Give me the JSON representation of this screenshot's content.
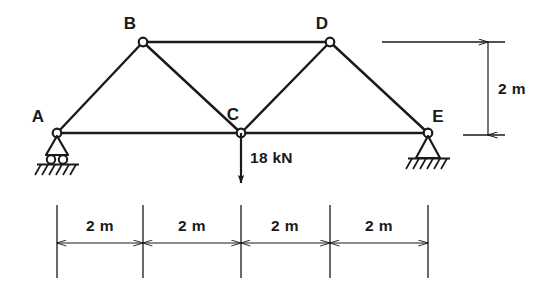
{
  "figure": {
    "type": "structural-truss-diagram",
    "background_color": "#ffffff",
    "line_color": "#1a1a1a"
  },
  "nodes": [
    {
      "id": "A",
      "label": "A",
      "x": 57,
      "y": 133,
      "label_x": 38,
      "label_y": 122,
      "support": "roller"
    },
    {
      "id": "B",
      "label": "B",
      "x": 143,
      "y": 42,
      "label_x": 130,
      "label_y": 29,
      "support": "none"
    },
    {
      "id": "C",
      "label": "C",
      "x": 241,
      "y": 133,
      "label_x": 233,
      "label_y": 120,
      "support": "none"
    },
    {
      "id": "D",
      "label": "D",
      "x": 330,
      "y": 42,
      "label_x": 322,
      "label_y": 29,
      "support": "none"
    },
    {
      "id": "E",
      "label": "E",
      "x": 428,
      "y": 133,
      "label_x": 438,
      "label_y": 122,
      "support": "pin"
    }
  ],
  "members": [
    {
      "from": "A",
      "to": "B"
    },
    {
      "from": "B",
      "to": "C"
    },
    {
      "from": "C",
      "to": "D"
    },
    {
      "from": "D",
      "to": "E"
    },
    {
      "from": "B",
      "to": "D"
    },
    {
      "from": "A",
      "to": "C"
    },
    {
      "from": "C",
      "to": "E"
    }
  ],
  "load": {
    "label": "18 kN",
    "magnitude": 18,
    "unit": "kN",
    "applied_at": "C",
    "direction": "down",
    "label_x": 252,
    "label_y": 163
  },
  "supports": {
    "A": {
      "type": "roller",
      "note": "roller support on rollers with ground hatching"
    },
    "E": {
      "type": "pin",
      "note": "pinned support with ground hatching"
    }
  },
  "horizontal_dimensions": {
    "label": "2 m",
    "segments": [
      {
        "label": "2 m",
        "from_x": 57,
        "to_x": 143,
        "text_x": 100,
        "text_y": 231
      },
      {
        "label": "2 m",
        "from_x": 143,
        "to_x": 241,
        "text_x": 192,
        "text_y": 231
      },
      {
        "label": "2 m",
        "from_x": 241,
        "to_x": 330,
        "text_x": 285,
        "text_y": 231
      },
      {
        "label": "2 m",
        "from_x": 330,
        "to_x": 428,
        "text_x": 379,
        "text_y": 231
      }
    ],
    "dim_line_y": 243,
    "ext_top_y": 205,
    "ext_bottom_y": 278
  },
  "vertical_dimension": {
    "label": "2 m",
    "x": 488,
    "top_y": 42,
    "bottom_y": 135,
    "text_x": 498,
    "text_y": 94,
    "upper_ref_line": {
      "x1": 382,
      "x2": 505,
      "y": 42
    },
    "lower_ref_line": {
      "x1": 463,
      "x2": 505,
      "y": 135
    }
  }
}
